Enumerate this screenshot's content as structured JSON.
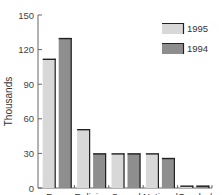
{
  "chart_data": {
    "type": "bar",
    "title": "",
    "xlabel": "",
    "ylabel": "Thousands",
    "ylim": [
      0,
      150
    ],
    "yticks": [
      0,
      30,
      60,
      90,
      120,
      150
    ],
    "grid": false,
    "legend_position": "top-right",
    "categories": [
      [
        "Race"
      ],
      [
        "Religion"
      ],
      [
        "Sexual",
        "orientation"
      ],
      [
        "National",
        "origin"
      ],
      [
        "Gender/",
        "disability"
      ]
    ],
    "series": [
      {
        "name": "1995",
        "color": "#d8d8d8",
        "values": [
          112,
          51,
          30,
          30,
          2
        ]
      },
      {
        "name": "1994",
        "color": "#8e8e8e",
        "values": [
          130,
          30,
          30,
          26,
          2
        ]
      }
    ],
    "edge_color": "#222222"
  }
}
